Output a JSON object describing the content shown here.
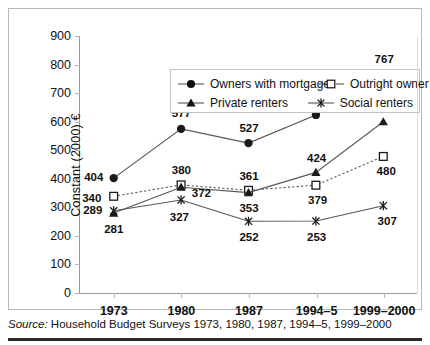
{
  "chart_data": {
    "type": "line",
    "title": "",
    "xlabel": "",
    "ylabel": "Constant (2000) €",
    "categories": [
      "1973",
      "1980",
      "1987",
      "1994–5",
      "1999–2000"
    ],
    "ylim": [
      0,
      900
    ],
    "ytick_step": 100,
    "yticks": [
      "900",
      "800",
      "700",
      "600",
      "500",
      "400",
      "300",
      "200",
      "100",
      "0"
    ],
    "grid": false,
    "legend_position": "top-center-inside",
    "series": [
      {
        "name": "Owners with mortgage",
        "marker": "filled-circle",
        "line_style": "solid",
        "color": "#1a1a1a",
        "values": [
          404,
          577,
          527,
          626,
          767
        ],
        "labels": [
          "404",
          "577",
          "527",
          "626",
          "767"
        ]
      },
      {
        "name": "Outright owner",
        "marker": "open-square",
        "line_style": "dotted",
        "color": "#1a1a1a",
        "values": [
          340,
          380,
          361,
          379,
          480
        ],
        "labels": [
          "340",
          "380",
          "361",
          "379",
          "480"
        ]
      },
      {
        "name": "Private renters",
        "marker": "filled-triangle",
        "line_style": "solid",
        "color": "#1a1a1a",
        "values": [
          281,
          372,
          353,
          424,
          602
        ],
        "labels": [
          "281",
          "372",
          "353",
          "424",
          "602"
        ]
      },
      {
        "name": "Social renters",
        "marker": "cross-x",
        "line_style": "solid",
        "color": "#1a1a1a",
        "values": [
          289,
          327,
          252,
          253,
          307
        ],
        "labels": [
          "289",
          "327",
          "252",
          "253",
          "307"
        ]
      }
    ]
  },
  "legend": {
    "items": [
      {
        "label": "Owners with mortgage",
        "key": "filled-circle-key"
      },
      {
        "label": "Outright owner",
        "key": "open-square-key"
      },
      {
        "label": "Private renters",
        "key": "filled-triangle-key"
      },
      {
        "label": "Social renters",
        "key": "cross-x-key"
      }
    ]
  },
  "source": {
    "prefix": "Source:",
    "text": "Household Budget Surveys 1973, 1980, 1987, 1994–5, 1999–2000"
  }
}
